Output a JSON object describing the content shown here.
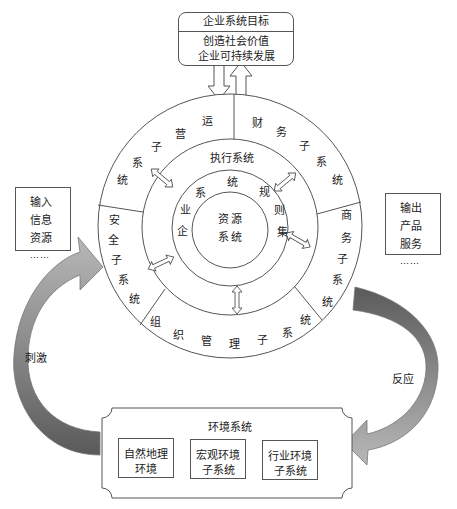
{
  "goal": {
    "title": "企业系统目标",
    "lines": [
      "创造社会价值",
      "企业可持续发展"
    ]
  },
  "input_box": {
    "lines": [
      "输入",
      "信息",
      "资源",
      "……"
    ]
  },
  "output_box": {
    "lines": [
      "输出",
      "产品",
      "服务",
      "……"
    ]
  },
  "core": {
    "line1": "资源",
    "line2": "系统"
  },
  "rules_ring": {
    "chars": [
      "企",
      "业",
      "系",
      "统",
      "规",
      "则",
      "集"
    ]
  },
  "exec_ring": {
    "label": "执行系统"
  },
  "outer_ring": {
    "operations": [
      "运",
      "营",
      "子",
      "系",
      "统"
    ],
    "finance": [
      "财",
      "务",
      "子",
      "系",
      "统"
    ],
    "commerce": [
      "商",
      "务",
      "子",
      "系",
      "统"
    ],
    "organization": [
      "组",
      "织",
      "管",
      "理",
      "子",
      "系",
      "统"
    ],
    "security": [
      "安",
      "全",
      "子",
      "系",
      "统"
    ]
  },
  "flows": {
    "stimulus": "刺激",
    "response": "反应"
  },
  "environment": {
    "title": "环境系统",
    "subsystems": [
      {
        "line1": "自然地理",
        "line2": "环境"
      },
      {
        "line1": "宏观环境",
        "line2": "子系统"
      },
      {
        "line1": "行业环境",
        "line2": "子系统"
      }
    ]
  },
  "colors": {
    "arrow_dark": "#6e6e6e",
    "arrow_light": "#b5b5b5",
    "line": "#555555"
  }
}
